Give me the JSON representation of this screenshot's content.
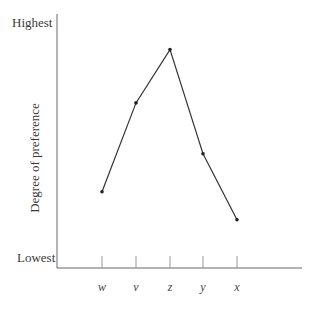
{
  "chart_data": {
    "type": "line",
    "title": "",
    "xlabel": "",
    "ylabel": "Degree of preference",
    "categories": [
      "w",
      "v",
      "z",
      "y",
      "x"
    ],
    "values": [
      3.0,
      6.5,
      8.6,
      4.5,
      1.9
    ],
    "ylim": [
      0,
      10
    ],
    "y_tick_labels": {
      "top": "Highest",
      "bottom": "Lowest"
    },
    "grid": false,
    "legend": null
  },
  "axis": {
    "y_top_label": "Highest",
    "y_bottom_label": "Lowest",
    "y_title": "Degree of preference"
  },
  "colors": {
    "line": "#333333",
    "axis": "#555555",
    "text": "#3a3a3a"
  }
}
